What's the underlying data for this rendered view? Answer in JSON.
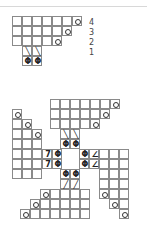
{
  "legend_chart": {
    "row_numbers": [
      "4",
      "3",
      "2",
      "1"
    ]
  },
  "symbols": {
    "yo": "yarn-over (circle)",
    "k2tog": "╲",
    "ssk": "╱",
    "twist_down": "Φ",
    "decrease_left": "7",
    "decrease_right": "∠"
  },
  "chart_data": {
    "type": "table",
    "cell_size_px": 10,
    "legend": {
      "rows": [
        {
          "row": 4,
          "plain": 6,
          "yo_col": 7
        },
        {
          "row": 3,
          "plain": 5,
          "yo_col": 6
        },
        {
          "row": 2,
          "plain": 4,
          "yo_col": 5
        },
        {
          "row": 1,
          "decrease_cells": 2,
          "offset_col": 2
        }
      ]
    },
    "pinwheel": {
      "arms": [
        "top",
        "right",
        "bottom",
        "left"
      ],
      "arm_rows": 3,
      "center_decreases_per_side": 2
    }
  }
}
